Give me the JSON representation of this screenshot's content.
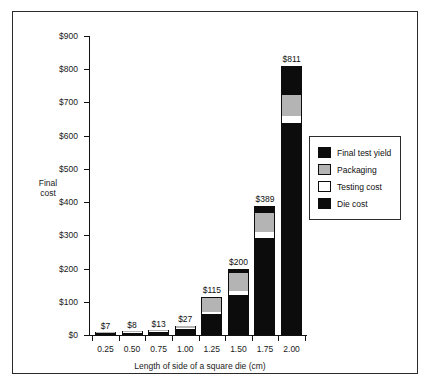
{
  "top_caption": "",
  "chart_data": {
    "type": "bar",
    "subtype": "stacked",
    "title": "",
    "xlabel": "Length of side of a square die (cm)",
    "ylabel": "Final\ncost",
    "ylabel_lines": [
      "Final",
      "cost"
    ],
    "categories": [
      "0.25",
      "0.50",
      "0.75",
      "1.00",
      "1.25",
      "1.50",
      "1.75",
      "2.00"
    ],
    "ylim": [
      0,
      900
    ],
    "ytick_values": [
      0,
      100,
      200,
      300,
      400,
      500,
      600,
      700,
      800,
      900
    ],
    "ytick_labels": [
      "$0",
      "$100",
      "$200",
      "$300",
      "$400",
      "$500",
      "$600",
      "$700",
      "$800",
      "$900"
    ],
    "grid": false,
    "legend_position": "right",
    "series": [
      {
        "name": "Die cost",
        "color": "#0c0c0c",
        "values": [
          5,
          6,
          9,
          19,
          62,
          121,
          292,
          638
        ]
      },
      {
        "name": "Testing cost",
        "color": "#ffffff",
        "values": [
          1,
          1,
          2,
          3,
          6,
          11,
          18,
          22
        ]
      },
      {
        "name": "Packaging",
        "color": "#b4b4b4",
        "values": [
          1,
          1,
          2,
          4,
          42,
          55,
          57,
          64
        ]
      },
      {
        "name": "Final test yield",
        "color": "#0c0c0c",
        "values": [
          0,
          0,
          0,
          1,
          5,
          13,
          22,
          87
        ]
      }
    ],
    "legend_order": [
      "Final test yield",
      "Packaging",
      "Testing cost",
      "Die cost"
    ],
    "totals": [
      7,
      8,
      13,
      27,
      115,
      200,
      389,
      811
    ],
    "total_labels": [
      "$7",
      "$8",
      "$13",
      "$27",
      "$115",
      "$200",
      "$389",
      "$811"
    ],
    "bars": [
      {
        "category": "0.25",
        "total": 7,
        "label": "$7",
        "segments": [
          {
            "name": "Die cost",
            "value": 5,
            "color": "#0c0c0c"
          },
          {
            "name": "Testing cost",
            "value": 1,
            "color": "#ffffff"
          },
          {
            "name": "Packaging",
            "value": 1,
            "color": "#b4b4b4"
          },
          {
            "name": "Final test yield",
            "value": 0,
            "color": "#0c0c0c"
          }
        ]
      },
      {
        "category": "0.50",
        "total": 8,
        "label": "$8",
        "segments": [
          {
            "name": "Die cost",
            "value": 6,
            "color": "#0c0c0c"
          },
          {
            "name": "Testing cost",
            "value": 1,
            "color": "#ffffff"
          },
          {
            "name": "Packaging",
            "value": 1,
            "color": "#b4b4b4"
          },
          {
            "name": "Final test yield",
            "value": 0,
            "color": "#0c0c0c"
          }
        ]
      },
      {
        "category": "0.75",
        "total": 13,
        "label": "$13",
        "segments": [
          {
            "name": "Die cost",
            "value": 9,
            "color": "#0c0c0c"
          },
          {
            "name": "Testing cost",
            "value": 2,
            "color": "#ffffff"
          },
          {
            "name": "Packaging",
            "value": 2,
            "color": "#b4b4b4"
          },
          {
            "name": "Final test yield",
            "value": 0,
            "color": "#0c0c0c"
          }
        ]
      },
      {
        "category": "1.00",
        "total": 27,
        "label": "$27",
        "segments": [
          {
            "name": "Die cost",
            "value": 19,
            "color": "#0c0c0c"
          },
          {
            "name": "Testing cost",
            "value": 3,
            "color": "#ffffff"
          },
          {
            "name": "Packaging",
            "value": 4,
            "color": "#b4b4b4"
          },
          {
            "name": "Final test yield",
            "value": 1,
            "color": "#0c0c0c"
          }
        ]
      },
      {
        "category": "1.25",
        "total": 115,
        "label": "$115",
        "segments": [
          {
            "name": "Die cost",
            "value": 62,
            "color": "#0c0c0c"
          },
          {
            "name": "Testing cost",
            "value": 6,
            "color": "#ffffff"
          },
          {
            "name": "Packaging",
            "value": 42,
            "color": "#b4b4b4"
          },
          {
            "name": "Final test yield",
            "value": 5,
            "color": "#0c0c0c"
          }
        ]
      },
      {
        "category": "1.50",
        "total": 200,
        "label": "$200",
        "segments": [
          {
            "name": "Die cost",
            "value": 121,
            "color": "#0c0c0c"
          },
          {
            "name": "Testing cost",
            "value": 11,
            "color": "#ffffff"
          },
          {
            "name": "Packaging",
            "value": 55,
            "color": "#b4b4b4"
          },
          {
            "name": "Final test yield",
            "value": 13,
            "color": "#0c0c0c"
          }
        ]
      },
      {
        "category": "1.75",
        "total": 389,
        "label": "$389",
        "segments": [
          {
            "name": "Die cost",
            "value": 292,
            "color": "#0c0c0c"
          },
          {
            "name": "Testing cost",
            "value": 18,
            "color": "#ffffff"
          },
          {
            "name": "Packaging",
            "value": 57,
            "color": "#b4b4b4"
          },
          {
            "name": "Final test yield",
            "value": 22,
            "color": "#0c0c0c"
          }
        ]
      },
      {
        "category": "2.00",
        "total": 811,
        "label": "$811",
        "segments": [
          {
            "name": "Die cost",
            "value": 638,
            "color": "#0c0c0c"
          },
          {
            "name": "Testing cost",
            "value": 22,
            "color": "#ffffff"
          },
          {
            "name": "Packaging",
            "value": 64,
            "color": "#b4b4b4"
          },
          {
            "name": "Final test yield",
            "value": 87,
            "color": "#0c0c0c"
          }
        ]
      }
    ]
  },
  "legend": {
    "items": [
      {
        "label": "Final test yield",
        "color": "#0c0c0c"
      },
      {
        "label": "Packaging",
        "color": "#b4b4b4"
      },
      {
        "label": "Testing cost",
        "color": "#ffffff"
      },
      {
        "label": "Die cost",
        "color": "#0c0c0c"
      }
    ]
  }
}
